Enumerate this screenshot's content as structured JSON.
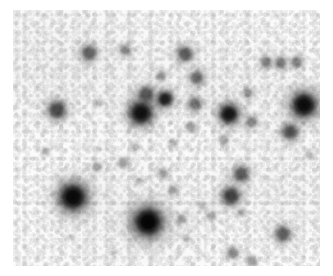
{
  "page": {
    "width": 333,
    "height": 276,
    "background_color": "#ffffff",
    "kind": "astronomical-star-field-image"
  },
  "plate": {
    "x": 13,
    "y": 10,
    "width": 307,
    "height": 256,
    "sky_color": "#fbfbfb",
    "star_color": "#000000",
    "polarity": "inverted-grayscale",
    "description": "Dense star field, dark point sources on light mottled sky background"
  },
  "chart_data": {
    "type": "scatter",
    "title": "",
    "xlabel": "",
    "ylabel": "",
    "xlim": [
      0,
      307
    ],
    "ylim": [
      0,
      256
    ],
    "grid": false,
    "legend": "none",
    "colormap": "gray-inverted",
    "point_field": "stellar_sources",
    "count": 46,
    "stars": [
      {
        "x": 76,
        "y": 43,
        "r": 8,
        "mag": 0.58
      },
      {
        "x": 112,
        "y": 40,
        "r": 6,
        "mag": 0.42
      },
      {
        "x": 172,
        "y": 44,
        "r": 8,
        "mag": 0.62
      },
      {
        "x": 253,
        "y": 52,
        "r": 6,
        "mag": 0.46
      },
      {
        "x": 268,
        "y": 53,
        "r": 6,
        "mag": 0.5
      },
      {
        "x": 284,
        "y": 52,
        "r": 6,
        "mag": 0.46
      },
      {
        "x": 148,
        "y": 66,
        "r": 5,
        "mag": 0.36
      },
      {
        "x": 184,
        "y": 68,
        "r": 7,
        "mag": 0.56
      },
      {
        "x": 235,
        "y": 83,
        "r": 5,
        "mag": 0.38
      },
      {
        "x": 44,
        "y": 100,
        "r": 9,
        "mag": 0.7
      },
      {
        "x": 86,
        "y": 93,
        "r": 4,
        "mag": 0.22
      },
      {
        "x": 133,
        "y": 84,
        "r": 8,
        "mag": 0.62
      },
      {
        "x": 152,
        "y": 89,
        "r": 8,
        "mag": 0.88
      },
      {
        "x": 128,
        "y": 103,
        "r": 12,
        "mag": 0.94
      },
      {
        "x": 182,
        "y": 94,
        "r": 7,
        "mag": 0.52
      },
      {
        "x": 216,
        "y": 104,
        "r": 10,
        "mag": 0.92
      },
      {
        "x": 291,
        "y": 95,
        "r": 13,
        "mag": 0.96
      },
      {
        "x": 239,
        "y": 112,
        "r": 6,
        "mag": 0.44
      },
      {
        "x": 313,
        "y": 101,
        "r": 4,
        "mag": 0.26
      },
      {
        "x": 178,
        "y": 117,
        "r": 5,
        "mag": 0.34
      },
      {
        "x": 277,
        "y": 122,
        "r": 8,
        "mag": 0.68
      },
      {
        "x": 211,
        "y": 130,
        "r": 5,
        "mag": 0.3
      },
      {
        "x": 33,
        "y": 141,
        "r": 4,
        "mag": 0.24
      },
      {
        "x": 86,
        "y": 139,
        "r": 3,
        "mag": 0.18
      },
      {
        "x": 123,
        "y": 137,
        "r": 4,
        "mag": 0.22
      },
      {
        "x": 160,
        "y": 133,
        "r": 4,
        "mag": 0.24
      },
      {
        "x": 296,
        "y": 145,
        "r": 4,
        "mag": 0.24
      },
      {
        "x": 84,
        "y": 157,
        "r": 5,
        "mag": 0.32
      },
      {
        "x": 110,
        "y": 153,
        "r": 5,
        "mag": 0.36
      },
      {
        "x": 150,
        "y": 163,
        "r": 5,
        "mag": 0.34
      },
      {
        "x": 228,
        "y": 164,
        "r": 8,
        "mag": 0.64
      },
      {
        "x": 60,
        "y": 187,
        "r": 14,
        "mag": 0.97
      },
      {
        "x": 126,
        "y": 171,
        "r": 4,
        "mag": 0.22
      },
      {
        "x": 160,
        "y": 180,
        "r": 5,
        "mag": 0.3
      },
      {
        "x": 218,
        "y": 186,
        "r": 9,
        "mag": 0.74
      },
      {
        "x": 189,
        "y": 196,
        "r": 4,
        "mag": 0.24
      },
      {
        "x": 228,
        "y": 203,
        "r": 4,
        "mag": 0.26
      },
      {
        "x": 135,
        "y": 212,
        "r": 15,
        "mag": 0.99
      },
      {
        "x": 169,
        "y": 209,
        "r": 5,
        "mag": 0.32
      },
      {
        "x": 198,
        "y": 206,
        "r": 5,
        "mag": 0.28
      },
      {
        "x": 270,
        "y": 224,
        "r": 8,
        "mag": 0.62
      },
      {
        "x": 173,
        "y": 228,
        "r": 4,
        "mag": 0.2
      },
      {
        "x": 220,
        "y": 243,
        "r": 6,
        "mag": 0.44
      },
      {
        "x": 239,
        "y": 251,
        "r": 5,
        "mag": 0.36
      },
      {
        "x": 101,
        "y": 243,
        "r": 3,
        "mag": 0.16
      },
      {
        "x": 57,
        "y": 227,
        "r": 3,
        "mag": 0.16
      }
    ]
  }
}
